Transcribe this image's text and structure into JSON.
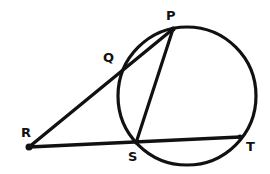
{
  "diagram": {
    "type": "circle-secant-geometry",
    "colors": {
      "stroke": "#111111",
      "background": "#ffffff"
    },
    "circle": {
      "cx": 187,
      "cy": 96,
      "r": 69
    },
    "points": {
      "P": {
        "label": "P",
        "x": 173,
        "y": 29
      },
      "Q": {
        "label": "Q",
        "x": 124,
        "y": 68
      },
      "R": {
        "label": "R",
        "x": 29,
        "y": 147
      },
      "S": {
        "label": "S",
        "x": 136,
        "y": 143
      },
      "T": {
        "label": "T",
        "x": 240,
        "y": 137
      }
    },
    "segments": [
      {
        "from": "R",
        "to": "P",
        "name": "secant-RP"
      },
      {
        "from": "R",
        "to": "T",
        "name": "secant-RT"
      },
      {
        "from": "P",
        "to": "S",
        "name": "chord-PS"
      }
    ],
    "labels": {
      "P": "P",
      "Q": "Q",
      "R": "R",
      "S": "S",
      "T": "T"
    }
  }
}
